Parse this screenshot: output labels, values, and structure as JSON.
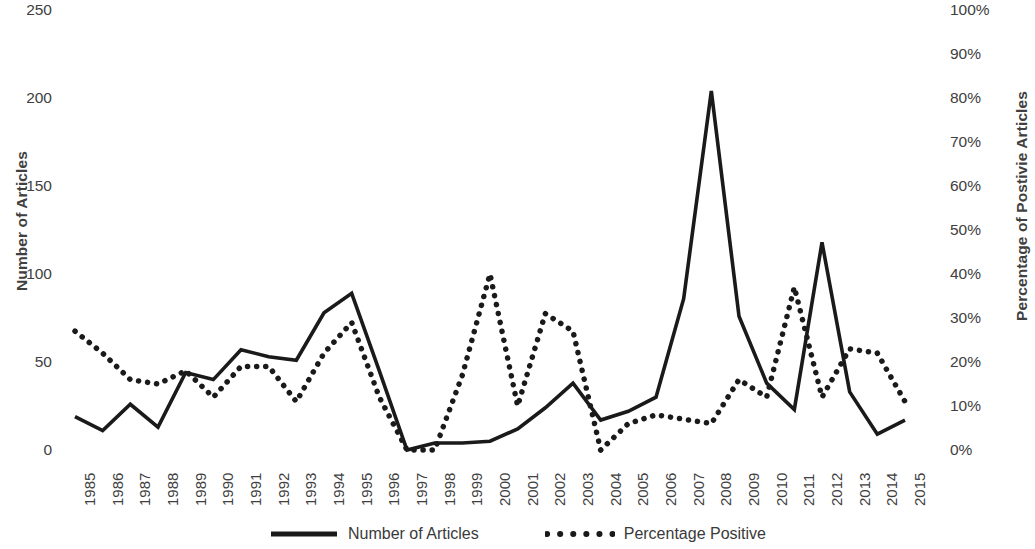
{
  "chart_data": {
    "type": "line",
    "title": "",
    "xlabel": "",
    "ylabel": "Number of Articles",
    "y2label": "Percentage of Postivie Articles",
    "grid": false,
    "legend_position": "bottom",
    "ylim": [
      0,
      250
    ],
    "y2lim": [
      0,
      100
    ],
    "y_ticks": [
      "0",
      "50",
      "100",
      "150",
      "200",
      "250"
    ],
    "y_tick_values": [
      0,
      50,
      100,
      150,
      200,
      250
    ],
    "y2_ticks": [
      "0%",
      "10%",
      "20%",
      "30%",
      "40%",
      "50%",
      "60%",
      "70%",
      "80%",
      "90%",
      "100%"
    ],
    "y2_tick_values": [
      0,
      10,
      20,
      30,
      40,
      50,
      60,
      70,
      80,
      90,
      100
    ],
    "categories": [
      "1985",
      "1986",
      "1987",
      "1988",
      "1989",
      "1990",
      "1991",
      "1992",
      "1993",
      "1994",
      "1995",
      "1996",
      "1997",
      "1998",
      "1999",
      "2000",
      "2001",
      "2002",
      "2003",
      "2004",
      "2005",
      "2006",
      "2007",
      "2008",
      "2009",
      "2010",
      "2011",
      "2012",
      "2013",
      "2014",
      "2015"
    ],
    "series": [
      {
        "name": "Number of Articles",
        "axis": "left",
        "style": "solid",
        "color": "#1a1a1a",
        "values": [
          19,
          11,
          26,
          13,
          44,
          40,
          57,
          53,
          51,
          78,
          89,
          45,
          0,
          4,
          4,
          5,
          12,
          24,
          38,
          17,
          22,
          30,
          86,
          204,
          76,
          38,
          23,
          118,
          33,
          9,
          17
        ]
      },
      {
        "name": "Percentage Positive",
        "axis": "right",
        "style": "dotted",
        "color": "#1a1a1a",
        "values": [
          27,
          22,
          16,
          15,
          18,
          12,
          19,
          19,
          11,
          22,
          29,
          12,
          0,
          0,
          17,
          40,
          10,
          31,
          27,
          0,
          6,
          8,
          7,
          6,
          16,
          12,
          37,
          12,
          23,
          22,
          11
        ]
      }
    ]
  },
  "legend": {
    "items": [
      {
        "label": "Number of Articles",
        "style": "solid"
      },
      {
        "label": "Percentage Positive",
        "style": "dotted"
      }
    ]
  }
}
